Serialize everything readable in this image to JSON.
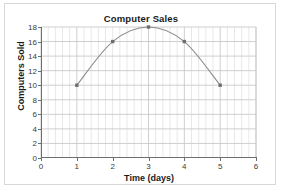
{
  "chart_data": {
    "type": "line",
    "title": "Computer Sales",
    "xlabel": "Time (days)",
    "ylabel": "Computers Sold",
    "x": [
      1,
      2,
      3,
      4,
      5
    ],
    "values": [
      10,
      16,
      18,
      16,
      10
    ],
    "series": [
      {
        "name": "Computers Sold",
        "x": [
          1,
          2,
          3,
          4,
          5
        ],
        "values": [
          10,
          16,
          18,
          16,
          10
        ]
      }
    ],
    "xlim": [
      0,
      6
    ],
    "ylim": [
      0,
      18
    ],
    "xticks": [
      "0",
      "1",
      "2",
      "3",
      "4",
      "5",
      "6"
    ],
    "yticks": [
      "0",
      "2",
      "4",
      "6",
      "8",
      "10",
      "12",
      "14",
      "16",
      "18"
    ],
    "xtick_values": [
      0,
      1,
      2,
      3,
      4,
      5,
      6
    ],
    "ytick_values": [
      0,
      2,
      4,
      6,
      8,
      10,
      12,
      14,
      16,
      18
    ],
    "x_minor_per_major": 5,
    "grid": true,
    "legend": "none",
    "marker": "square",
    "colors": {
      "line": "#8c8c8c",
      "marker": "#6e6e6e",
      "grid": "#c9c9c9",
      "grid_minor": "#dededa",
      "axis": "#6e6e6e",
      "text": "#1a1a1a",
      "tick_text": "#3a3a3a",
      "background": "#ffffff",
      "frame": "#d8d8d8"
    }
  }
}
